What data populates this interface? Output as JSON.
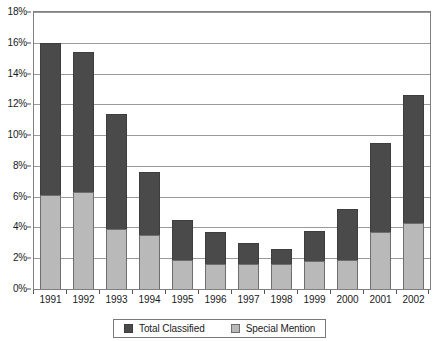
{
  "chart_data": {
    "type": "bar",
    "stacked": true,
    "title": "",
    "subtitle": "",
    "xlabel": "",
    "ylabel": "",
    "grid": true,
    "legend_position": "bottom",
    "categories": [
      "1991",
      "1992",
      "1993",
      "1994",
      "1995",
      "1996",
      "1997",
      "1998",
      "1999",
      "2000",
      "2001",
      "2002"
    ],
    "ylim": [
      0,
      18
    ],
    "y_tick_labels": [
      "0%",
      "2%",
      "4%",
      "6%",
      "8%",
      "10%",
      "12%",
      "14%",
      "16%",
      "18%"
    ],
    "y_tick_values": [
      0,
      2,
      4,
      6,
      8,
      10,
      12,
      14,
      16,
      18
    ],
    "value_suffix": "%",
    "series": [
      {
        "name": "Total Classified",
        "color": "#4a4a4a",
        "values": [
          16.0,
          15.4,
          11.4,
          7.6,
          4.5,
          3.7,
          3.0,
          2.6,
          3.8,
          5.2,
          9.5,
          12.6
        ],
        "note": "values are cumulative stack totals (top of bar)"
      },
      {
        "name": "Special Mention",
        "color": "#b9b9b9",
        "values": [
          6.1,
          6.3,
          3.9,
          3.5,
          1.9,
          1.6,
          1.6,
          1.6,
          1.8,
          1.9,
          3.7,
          4.3
        ],
        "note": "values are the lower (light) segment heights"
      }
    ]
  },
  "legend": {
    "entries": [
      {
        "label": "Total Classified",
        "swatch": "dark"
      },
      {
        "label": "Special Mention",
        "swatch": "light"
      }
    ]
  }
}
